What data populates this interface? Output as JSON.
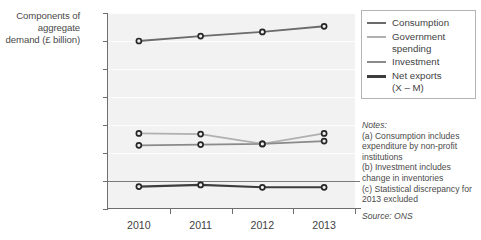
{
  "axis": {
    "ylabel_text": "Components\nof aggregate\ndemand\n(£ billion)",
    "yticks": [
      "1200",
      "1000",
      "800",
      "600",
      "400",
      "200",
      "0",
      "-200"
    ],
    "xticks": [
      "2010",
      "2011",
      "2012",
      "2013"
    ]
  },
  "legend": {
    "items": [
      {
        "label": "Consumption",
        "color": "#6b6b6b",
        "width": "2px"
      },
      {
        "label": "Government\nspending",
        "color": "#b0b0b0",
        "width": "2px"
      },
      {
        "label": "Investment",
        "color": "#8a8a8a",
        "width": "2px"
      },
      {
        "label": "Net exports\n(X – M)",
        "color": "#3d3d3d",
        "width": "2.6px"
      }
    ]
  },
  "notes": {
    "heading": "Notes:",
    "lines": [
      "(a) Consumption includes expenditure by non-profit institutions",
      "(b) Investment includes change in inventories",
      "(c) Statistical discrepancy for 2013 excluded"
    ],
    "source": "Source: ONS"
  },
  "chart_data": {
    "type": "line",
    "title": "",
    "xlabel": "",
    "ylabel": "Components of aggregate demand (£ billion)",
    "categories": [
      "2010",
      "2011",
      "2012",
      "2013"
    ],
    "ylim": [
      -200,
      1200
    ],
    "ytick_step": 200,
    "grid": true,
    "legend_position": "right",
    "series": [
      {
        "name": "Consumption",
        "values": [
          1000,
          1035,
          1065,
          1105
        ],
        "color": "#6b6b6b"
      },
      {
        "name": "Government spending",
        "values": [
          340,
          335,
          265,
          340
        ],
        "color": "#b0b0b0"
      },
      {
        "name": "Investment",
        "values": [
          255,
          260,
          265,
          285
        ],
        "color": "#8a8a8a"
      },
      {
        "name": "Net exports (X – M)",
        "values": [
          -40,
          -28,
          -45,
          -45
        ],
        "color": "#3d3d3d"
      }
    ],
    "annotations": [
      "Notes: (a) Consumption includes expenditure by non-profit institutions",
      "(b) Investment includes change in inventories",
      "(c) Statistical discrepancy for 2013 excluded",
      "Source: ONS"
    ]
  }
}
